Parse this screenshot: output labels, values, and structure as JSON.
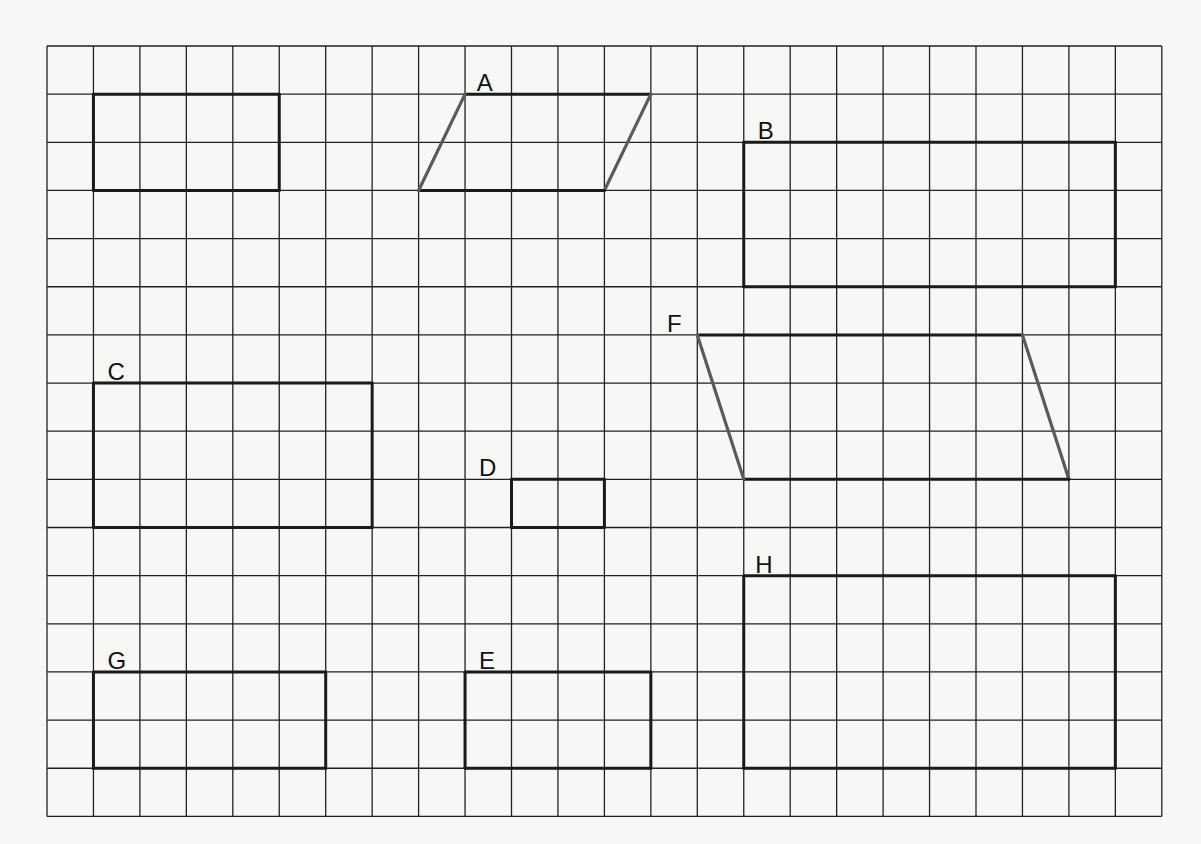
{
  "grid": {
    "origin_x": 47,
    "origin_y": 46,
    "cols": 24,
    "rows": 16,
    "cell_w": 46.45,
    "cell_h": 48.15,
    "line_color": "#222222",
    "line_width": 1.3
  },
  "colors": {
    "background": "#f7f7f6",
    "shape_stroke": "#1a1a1a",
    "slant_stroke": "#5a5a5a"
  },
  "shapes": [
    {
      "id": "unlabeled",
      "label": "",
      "type": "rectangle",
      "points": [
        [
          1,
          1
        ],
        [
          5,
          1
        ],
        [
          5,
          3
        ],
        [
          1,
          3
        ]
      ],
      "label_pos": null
    },
    {
      "id": "A",
      "label": "A",
      "type": "parallelogram",
      "points": [
        [
          9,
          1
        ],
        [
          13,
          1
        ],
        [
          12,
          3
        ],
        [
          8,
          3
        ]
      ],
      "label_pos": [
        9.25,
        0.75
      ]
    },
    {
      "id": "B",
      "label": "B",
      "type": "rectangle",
      "points": [
        [
          15,
          2
        ],
        [
          23,
          2
        ],
        [
          23,
          5
        ],
        [
          15,
          5
        ]
      ],
      "label_pos": [
        15.3,
        1.75
      ]
    },
    {
      "id": "C",
      "label": "C",
      "type": "rectangle",
      "points": [
        [
          1,
          7
        ],
        [
          7,
          7
        ],
        [
          7,
          10
        ],
        [
          1,
          10
        ]
      ],
      "label_pos": [
        1.3,
        6.75
      ]
    },
    {
      "id": "D",
      "label": "D",
      "type": "rectangle",
      "points": [
        [
          10,
          9
        ],
        [
          12,
          9
        ],
        [
          12,
          10
        ],
        [
          10,
          10
        ]
      ],
      "label_pos": [
        9.3,
        8.75
      ]
    },
    {
      "id": "E",
      "label": "E",
      "type": "rectangle",
      "points": [
        [
          9,
          13
        ],
        [
          13,
          13
        ],
        [
          13,
          15
        ],
        [
          9,
          15
        ]
      ],
      "label_pos": [
        9.3,
        12.75
      ]
    },
    {
      "id": "F",
      "label": "F",
      "type": "parallelogram",
      "points": [
        [
          14,
          6
        ],
        [
          21,
          6
        ],
        [
          22,
          9
        ],
        [
          15,
          9
        ]
      ],
      "label_pos": [
        13.35,
        5.75
      ]
    },
    {
      "id": "G",
      "label": "G",
      "type": "rectangle",
      "points": [
        [
          1,
          13
        ],
        [
          6,
          13
        ],
        [
          6,
          15
        ],
        [
          1,
          15
        ]
      ],
      "label_pos": [
        1.3,
        12.75
      ]
    },
    {
      "id": "H",
      "label": "H",
      "type": "rectangle",
      "points": [
        [
          15,
          11
        ],
        [
          23,
          11
        ],
        [
          23,
          15
        ],
        [
          15,
          15
        ]
      ],
      "label_pos": [
        15.25,
        10.75
      ]
    }
  ]
}
